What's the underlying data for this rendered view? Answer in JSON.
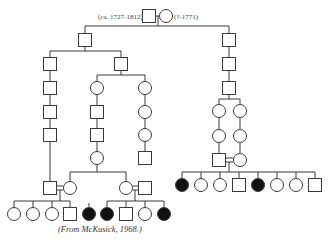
{
  "founders": {
    "male_label": "(ca. 1727-1812)",
    "female_label": "(?-1771)"
  },
  "caption": "(From McKusick, 1968.)",
  "colors": {
    "line": "#3a3a3a",
    "affected": "#111111",
    "unaffected": "#ffffff"
  },
  "individuals": [
    {
      "id": "I-1",
      "sex": "male",
      "x": 149,
      "y": 16,
      "affected": false
    },
    {
      "id": "I-2",
      "sex": "female",
      "x": 166,
      "y": 16,
      "affected": false
    },
    {
      "id": "II-1",
      "sex": "male",
      "x": 85,
      "y": 40,
      "affected": false
    },
    {
      "id": "II-2",
      "sex": "male",
      "x": 229,
      "y": 40,
      "affected": false
    },
    {
      "id": "III-1",
      "sex": "male",
      "x": 50,
      "y": 64,
      "affected": false
    },
    {
      "id": "III-2",
      "sex": "male",
      "x": 121,
      "y": 64,
      "affected": false
    },
    {
      "id": "III-3",
      "sex": "male",
      "x": 229,
      "y": 64,
      "affected": false
    },
    {
      "id": "IV-1",
      "sex": "male",
      "x": 50,
      "y": 88,
      "affected": false
    },
    {
      "id": "IV-2",
      "sex": "female",
      "x": 97,
      "y": 88,
      "affected": false
    },
    {
      "id": "IV-3",
      "sex": "female",
      "x": 145,
      "y": 88,
      "affected": false
    },
    {
      "id": "IV-4",
      "sex": "male",
      "x": 229,
      "y": 88,
      "affected": false
    },
    {
      "id": "V-1",
      "sex": "male",
      "x": 50,
      "y": 112,
      "affected": false
    },
    {
      "id": "V-2",
      "sex": "male",
      "x": 97,
      "y": 112,
      "affected": false
    },
    {
      "id": "V-3",
      "sex": "female",
      "x": 145,
      "y": 112,
      "affected": false
    },
    {
      "id": "V-4",
      "sex": "female",
      "x": 219,
      "y": 111,
      "affected": false
    },
    {
      "id": "V-5",
      "sex": "female",
      "x": 240,
      "y": 111,
      "affected": false
    },
    {
      "id": "VI-1",
      "sex": "male",
      "x": 50,
      "y": 135,
      "affected": false
    },
    {
      "id": "VI-2",
      "sex": "male",
      "x": 97,
      "y": 135,
      "affected": false
    },
    {
      "id": "VI-3",
      "sex": "female",
      "x": 145,
      "y": 135,
      "affected": false
    },
    {
      "id": "VI-4",
      "sex": "female",
      "x": 219,
      "y": 136,
      "affected": false
    },
    {
      "id": "VI-5",
      "sex": "female",
      "x": 240,
      "y": 136,
      "affected": false
    },
    {
      "id": "VII-0",
      "sex": "female",
      "x": 97,
      "y": 158,
      "affected": false
    },
    {
      "id": "VII-0b",
      "sex": "male",
      "x": 145,
      "y": 158,
      "affected": false
    },
    {
      "id": "VII-1",
      "sex": "male",
      "x": 50,
      "y": 188,
      "affected": false
    },
    {
      "id": "VII-2",
      "sex": "female",
      "x": 70,
      "y": 188,
      "affected": false
    },
    {
      "id": "VII-3",
      "sex": "female",
      "x": 126,
      "y": 188,
      "affected": false
    },
    {
      "id": "VII-4",
      "sex": "male",
      "x": 145,
      "y": 188,
      "affected": false
    },
    {
      "id": "VII-5",
      "sex": "male",
      "x": 219,
      "y": 160,
      "affected": false
    },
    {
      "id": "VII-6",
      "sex": "female",
      "x": 240,
      "y": 160,
      "affected": false
    },
    {
      "id": "VIII-1",
      "sex": "female",
      "x": 14,
      "y": 214,
      "affected": false
    },
    {
      "id": "VIII-2",
      "sex": "female",
      "x": 33,
      "y": 214,
      "affected": false
    },
    {
      "id": "VIII-3",
      "sex": "female",
      "x": 52,
      "y": 214,
      "affected": false
    },
    {
      "id": "VIII-4",
      "sex": "male",
      "x": 70,
      "y": 214,
      "affected": false
    },
    {
      "id": "VIII-5",
      "sex": "female",
      "x": 89,
      "y": 214,
      "affected": true
    },
    {
      "id": "VIII-6",
      "sex": "female",
      "x": 107,
      "y": 214,
      "affected": true
    },
    {
      "id": "VIII-7",
      "sex": "male",
      "x": 126,
      "y": 214,
      "affected": false
    },
    {
      "id": "VIII-8",
      "sex": "female",
      "x": 145,
      "y": 214,
      "affected": false
    },
    {
      "id": "VIII-9",
      "sex": "female",
      "x": 164,
      "y": 214,
      "affected": true
    },
    {
      "id": "VIII-10",
      "sex": "female",
      "x": 182,
      "y": 185,
      "affected": true
    },
    {
      "id": "VIII-11",
      "sex": "female",
      "x": 201,
      "y": 185,
      "affected": false
    },
    {
      "id": "VIII-12",
      "sex": "female",
      "x": 220,
      "y": 185,
      "affected": false
    },
    {
      "id": "VIII-13",
      "sex": "male",
      "x": 239,
      "y": 185,
      "affected": false
    },
    {
      "id": "VIII-14",
      "sex": "female",
      "x": 258,
      "y": 185,
      "affected": true
    },
    {
      "id": "VIII-15",
      "sex": "female",
      "x": 277,
      "y": 185,
      "affected": false
    },
    {
      "id": "VIII-16",
      "sex": "female",
      "x": 296,
      "y": 185,
      "affected": false
    },
    {
      "id": "VIII-17",
      "sex": "male",
      "x": 315,
      "y": 185,
      "affected": false
    }
  ],
  "lines": [
    [
      156,
      16,
      159,
      16
    ],
    [
      158,
      16,
      158,
      26
    ],
    [
      85,
      26,
      229,
      26
    ],
    [
      85,
      26,
      85,
      33
    ],
    [
      229,
      26,
      229,
      33
    ],
    [
      85,
      47,
      85,
      51
    ],
    [
      50,
      51,
      121,
      51
    ],
    [
      50,
      51,
      50,
      57
    ],
    [
      121,
      51,
      121,
      57
    ],
    [
      229,
      47,
      229,
      57
    ],
    [
      229,
      71,
      229,
      81
    ],
    [
      50,
      71,
      50,
      81
    ],
    [
      50,
      95,
      50,
      105
    ],
    [
      50,
      119,
      50,
      128
    ],
    [
      50,
      142,
      50,
      181
    ],
    [
      121,
      71,
      121,
      75
    ],
    [
      97,
      75,
      145,
      75
    ],
    [
      97,
      75,
      97,
      81
    ],
    [
      145,
      75,
      145,
      81
    ],
    [
      97,
      95,
      97,
      105
    ],
    [
      97,
      119,
      97,
      128
    ],
    [
      97,
      142,
      97,
      151
    ],
    [
      145,
      95,
      145,
      105
    ],
    [
      145,
      119,
      145,
      128
    ],
    [
      145,
      142,
      145,
      151
    ],
    [
      97,
      165,
      97,
      172
    ],
    [
      70,
      172,
      126,
      172
    ],
    [
      70,
      172,
      70,
      181
    ],
    [
      126,
      172,
      126,
      181
    ],
    [
      229,
      95,
      229,
      99
    ],
    [
      219,
      99,
      240,
      99
    ],
    [
      219,
      99,
      219,
      104
    ],
    [
      240,
      99,
      240,
      104
    ],
    [
      219,
      118,
      219,
      129
    ],
    [
      240,
      118,
      240,
      129
    ],
    [
      219,
      143,
      219,
      153
    ],
    [
      240,
      143,
      240,
      153
    ],
    [
      57,
      186,
      63,
      186
    ],
    [
      57,
      190,
      63,
      190
    ],
    [
      60,
      190,
      60,
      201
    ],
    [
      14,
      201,
      70,
      201
    ],
    [
      14,
      201,
      14,
      207
    ],
    [
      33,
      201,
      33,
      207
    ],
    [
      52,
      201,
      52,
      207
    ],
    [
      70,
      201,
      70,
      207
    ],
    [
      89,
      203,
      89,
      207
    ],
    [
      133,
      186,
      138,
      186
    ],
    [
      133,
      190,
      138,
      190
    ],
    [
      135,
      190,
      135,
      201
    ],
    [
      107,
      201,
      164,
      201
    ],
    [
      107,
      201,
      107,
      207
    ],
    [
      126,
      201,
      126,
      207
    ],
    [
      145,
      201,
      145,
      207
    ],
    [
      164,
      201,
      164,
      207
    ],
    [
      226,
      158,
      233,
      158
    ],
    [
      226,
      162,
      233,
      162
    ],
    [
      229,
      162,
      229,
      172
    ],
    [
      182,
      172,
      315,
      172
    ],
    [
      182,
      172,
      182,
      178
    ],
    [
      201,
      172,
      201,
      178
    ],
    [
      220,
      172,
      220,
      178
    ],
    [
      239,
      172,
      239,
      178
    ],
    [
      258,
      172,
      258,
      178
    ],
    [
      277,
      172,
      277,
      178
    ],
    [
      296,
      172,
      296,
      178
    ],
    [
      315,
      172,
      315,
      178
    ]
  ]
}
